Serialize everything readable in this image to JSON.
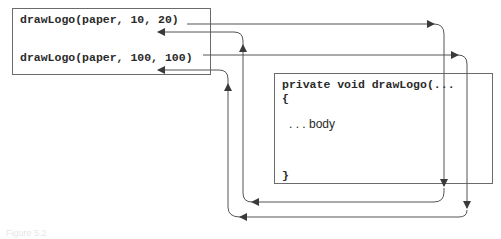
{
  "caller_box": {
    "calls": [
      {
        "label": "drawLogo(paper, 10, 20)"
      },
      {
        "label": "drawLogo(paper, 100, 100)"
      }
    ]
  },
  "method_box": {
    "signature": "private void drawLogo(...",
    "open_brace": "{",
    "body": ". . . body",
    "close_brace": "}"
  },
  "arrows": [
    {
      "name": "call-1-to-method",
      "from": "drawLogo(paper, 10, 20)",
      "to": "method",
      "direction": "outgoing"
    },
    {
      "name": "call-2-to-method",
      "from": "drawLogo(paper, 100, 100)",
      "to": "method",
      "direction": "outgoing"
    },
    {
      "name": "return-to-call-1",
      "from": "method",
      "to": "drawLogo(paper, 10, 20)",
      "direction": "return"
    },
    {
      "name": "return-to-call-2",
      "from": "method",
      "to": "drawLogo(paper, 100, 100)",
      "direction": "return"
    }
  ],
  "colors": {
    "line": "#555555",
    "box_border": "#6b6b6b",
    "text": "#2a2a2a"
  },
  "caption": "Figure 5.2"
}
